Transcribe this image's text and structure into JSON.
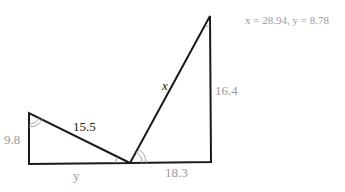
{
  "answer": {
    "text": "x = 28.94, y = 8.78"
  },
  "labels": {
    "left_vertical": "9.8",
    "hypotenuse_left": "15.5",
    "bottom_left": "y",
    "bottom_right": "18.3",
    "hypotenuse_right": "x",
    "right_vertical": "16.4"
  },
  "colors": {
    "line": "#1a1a1a",
    "given_label": "#9a9a9a",
    "key_label": "#222222",
    "arc": "#999999"
  }
}
